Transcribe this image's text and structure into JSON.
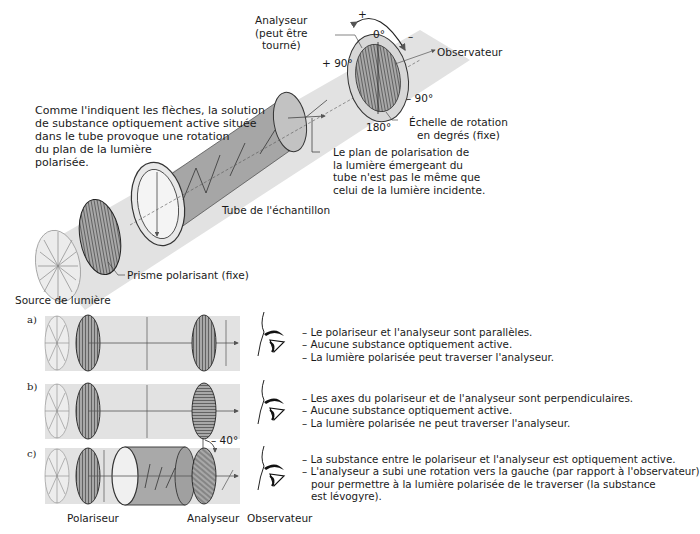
{
  "top_figure": {
    "analyseur_label": [
      "Analyseur",
      "(peut être",
      "tourné)"
    ],
    "plus_sign": "+",
    "minus_sign": "–",
    "zero_deg": "0°",
    "plus90": "+ 90°",
    "minus90": "– 90°",
    "deg180": "180°",
    "observateur": "Observateur",
    "echelle": [
      "Échelle de rotation",
      "en degrés (fixe)"
    ],
    "comment": [
      "Comme l'indiquent les flèches, la solution",
      "de substance optiquement active située",
      "dans le tube provoque une rotation",
      "du plan de la lumière",
      "polarisée."
    ],
    "plan_note": [
      "Le plan de polarisation de",
      "la lumière émergeant du",
      "tube n'est pas le même que",
      "celui de la lumière incidente."
    ],
    "tube_label": "Tube de l'échantillon",
    "prisme_label": "Prisme polarisant (fixe)",
    "source_label": "Source de lumière"
  },
  "rows": [
    {
      "letter": "a)",
      "lines": [
        "– Le polariseur et l'analyseur sont parallèles.",
        "– Aucune substance optiquement active.",
        "– La lumière polarisée peut traverser l'analyseur."
      ]
    },
    {
      "letter": "b)",
      "lines": [
        "– Les axes du polariseur et de l'analyseur sont perpendiculaires.",
        "– Aucune substance optiquement active.",
        "– La lumière polarisée ne peut traverser l'analyseur."
      ]
    },
    {
      "letter": "c)",
      "lines": [
        "– La substance entre le polariseur et l'analyseur est optiquement active.",
        "– L'analyseur a subi une rotation vers la gauche (par rapport à l'observateur)",
        "pour permettre à la lumière polarisée de le traverser (la substance",
        "est lévogyre)."
      ],
      "angle": "– 40°"
    }
  ],
  "bottom_labels": {
    "polariseur": "Polariseur",
    "analyseur": "Analyseur",
    "observateur": "Observateur"
  },
  "colors": {
    "beam": "#d9d9d9",
    "tube": "#a9a9a9",
    "filter": "#9a9a9a",
    "line": "#333333"
  }
}
